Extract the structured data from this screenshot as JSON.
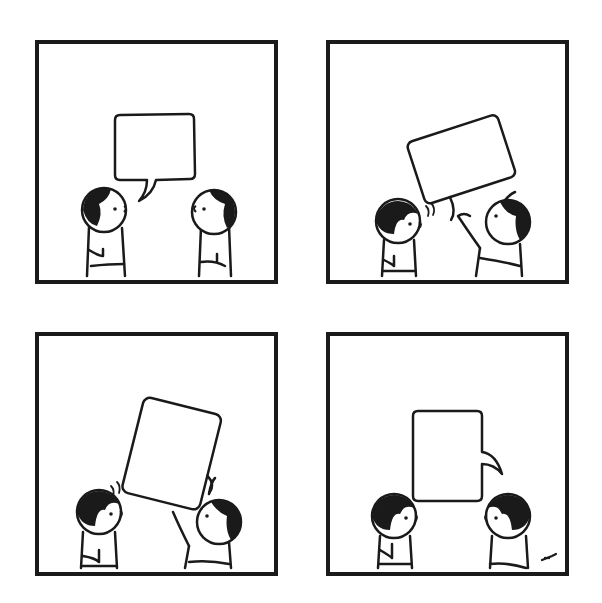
{
  "comic": {
    "layout": "2x2 grid",
    "ink_color": "#1a1a1a",
    "paper_color": "#ffffff",
    "panels": [
      {
        "index": 1,
        "description": "Two children face each other; left child speaks, empty rectangular speech bubble above"
      },
      {
        "index": 2,
        "description": "Right child grabs the empty speech bubble and lifts it, tilting it"
      },
      {
        "index": 3,
        "description": "Right child hoists the tilted bubble higher; left child looks on with motion lines"
      },
      {
        "index": 4,
        "description": "Empty bubble now upright with its tail pointing at the right child"
      }
    ],
    "signature": "artist signature mark (bottom-right of panel 4)"
  }
}
